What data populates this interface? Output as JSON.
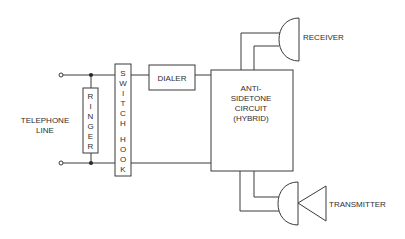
{
  "diagram": {
    "labels": {
      "telephone_line": [
        "TELEPHONE",
        "LINE"
      ],
      "ringer": [
        "R",
        "I",
        "N",
        "G",
        "E",
        "R"
      ],
      "switch_hook": [
        "S",
        "W",
        "I",
        "T",
        "C",
        "H",
        "",
        "H",
        "O",
        "O",
        "K"
      ],
      "dialer": "DIALER",
      "hybrid": [
        "ANTI-",
        "SIDETONE",
        "CIRCUIT",
        "(HYBRID)"
      ],
      "receiver": "RECEIVER",
      "transmitter": "TRANSMITTER"
    },
    "colors": {
      "line": "#3a3a3a",
      "text": "#2e2e2e",
      "background": "#ffffff"
    }
  }
}
